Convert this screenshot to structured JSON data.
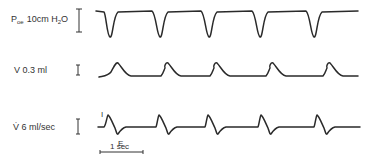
{
  "chart_data": {
    "type": "line",
    "title": "",
    "xlabel": "",
    "scale_bar": {
      "label": "1 sec",
      "seconds": 1
    },
    "series": [
      {
        "name": "Poe",
        "label_main": "P",
        "label_sub": "oe",
        "label_rest": "10cm H",
        "label_sub2": "2",
        "label_end": "O",
        "calibration": "10cm H2O",
        "shape": "square wave with sharp negative dips",
        "cycles": 5,
        "period_sec": 1.15,
        "amplitude_cmH2O": -11
      },
      {
        "name": "V",
        "label": "V  0.3 ml",
        "calibration": "0.3 ml",
        "shape": "rounded peaks on flat baseline",
        "cycles": 5,
        "period_sec": 1.15,
        "amplitude_ml": 0.4
      },
      {
        "name": "V-dot",
        "label": "V̇  6 ml/sec",
        "calibration": "6 ml/sec",
        "shape": "biphasic: inspiratory peak then expiratory trough",
        "cycles": 5,
        "period_sec": 1.15,
        "annotations": [
          "I",
          "E"
        ]
      }
    ]
  },
  "labels": {
    "poe_p": "P",
    "poe_sub": "oe",
    "poe_cal": "10cm H",
    "poe_h2": "2",
    "poe_o": "O",
    "v": "V  0.3 ml",
    "vdot": "V̇  6 ml/sec",
    "inspiration": "I",
    "expiration": "E",
    "time": "1 sec"
  }
}
